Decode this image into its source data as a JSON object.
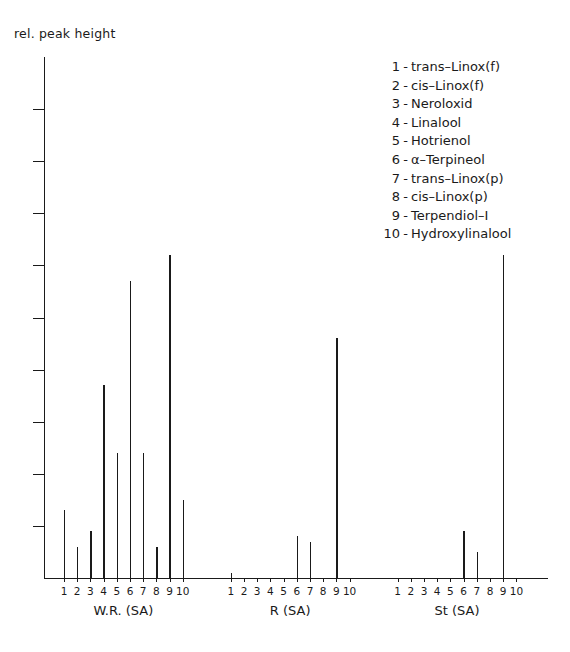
{
  "axis": {
    "ylabel": "rel. peak height",
    "y_tick_count": 9
  },
  "legend": {
    "entries": [
      {
        "num": "1",
        "dash": "-",
        "name": "trans–Linox(f)"
      },
      {
        "num": "2",
        "dash": "-",
        "name": "cis–Linox(f)"
      },
      {
        "num": "3",
        "dash": "-",
        "name": "Neroloxid"
      },
      {
        "num": "4",
        "dash": "-",
        "name": "Linalool"
      },
      {
        "num": "5",
        "dash": "-",
        "name": "Hotrienol"
      },
      {
        "num": "6",
        "dash": "-",
        "name": "α–Terpineol"
      },
      {
        "num": "7",
        "dash": "-",
        "name": "trans–Linox(p)"
      },
      {
        "num": "8",
        "dash": "-",
        "name": "cis–Linox(p)"
      },
      {
        "num": "9",
        "dash": "-",
        "name": "Terpendiol–I"
      },
      {
        "num": "10",
        "dash": "-",
        "name": "Hydroxylinalool"
      }
    ]
  },
  "chart_data": {
    "type": "bar",
    "title": "",
    "subtitle": "",
    "xlabel": "",
    "ylabel": "rel. peak height",
    "ylim": [
      0,
      100
    ],
    "grid": false,
    "legend_position": "top-right",
    "categories": [
      "1",
      "2",
      "3",
      "4",
      "5",
      "6",
      "7",
      "8",
      "9",
      "10"
    ],
    "category_names": [
      "trans-Linox(f)",
      "cis-Linox(f)",
      "Neroloxid",
      "Linalool",
      "Hotrienol",
      "α-Terpineol",
      "trans-Linox(p)",
      "cis-Linox(p)",
      "Terpendiol-I",
      "Hydroxylinalool"
    ],
    "groups": [
      {
        "label": "W.R.  (SA)",
        "values": [
          13,
          6,
          9,
          37,
          24,
          57,
          24,
          6,
          62,
          15
        ]
      },
      {
        "label": "R  (SA)",
        "values": [
          1,
          0,
          0,
          0,
          0,
          8,
          7,
          0,
          46,
          0
        ]
      },
      {
        "label": "St  (SA)",
        "values": [
          0,
          0,
          0,
          0,
          0,
          9,
          5,
          0,
          62,
          0
        ]
      }
    ]
  },
  "colors": {
    "ink": "#1a1a1a",
    "background": "#ffffff"
  }
}
